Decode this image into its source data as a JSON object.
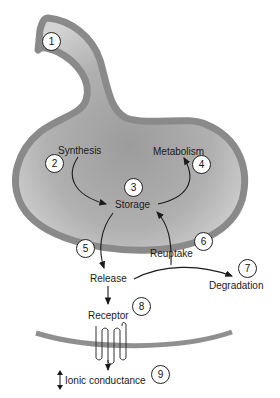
{
  "diagram": {
    "type": "neurotransmitter-synapse-cycle",
    "colors": {
      "membrane": "#8c8c8c",
      "terminal_fill_center": "#a6a6a6",
      "terminal_fill_edge": "#cfcfcf",
      "arrow": "#1a1a1a"
    },
    "labels": {
      "synthesis": "Synthesis",
      "metabolism": "Metabolism",
      "storage": "Storage",
      "release": "Release",
      "reuptake": "Reuptake",
      "degradation": "Degradation",
      "receptor": "Receptor",
      "ionic_conductance": "Ionic conductance"
    },
    "steps": [
      {
        "number": "1"
      },
      {
        "number": "2"
      },
      {
        "number": "3"
      },
      {
        "number": "4"
      },
      {
        "number": "5"
      },
      {
        "number": "6"
      },
      {
        "number": "7"
      },
      {
        "number": "8"
      },
      {
        "number": "9"
      }
    ]
  }
}
